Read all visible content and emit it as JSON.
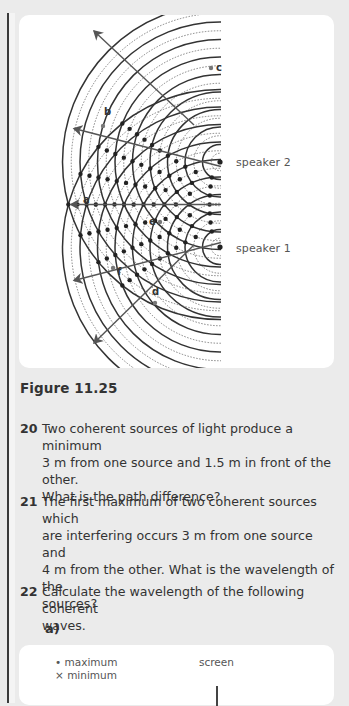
{
  "figure": {
    "speakers": [
      {
        "label": "speaker 2",
        "x": 220,
        "y": 162
      },
      {
        "label": "speaker 1",
        "x": 220,
        "y": 247
      }
    ],
    "points": [
      {
        "label": "a",
        "lx": 83,
        "ly": 200
      },
      {
        "label": "b",
        "lx": 103,
        "ly": 116
      },
      {
        "label": "c",
        "lx": 215,
        "ly": 72
      },
      {
        "label": "d",
        "lx": 152,
        "ly": 297
      },
      {
        "label": "e",
        "lx": 148,
        "ly": 226
      },
      {
        "label": "f",
        "lx": 115,
        "ly": 276
      }
    ],
    "caption": "Figure 11.25"
  },
  "questions": [
    {
      "number": "20",
      "lines": [
        "Two coherent sources of light produce a minimum",
        "3 m from one source and 1.5 m in front of the other.",
        "What is the path difference?"
      ]
    },
    {
      "number": "21",
      "lines": [
        "The first maximum of two coherent sources which",
        "are interfering occurs 3 m from one source and",
        "4 m from the other. What is the wavelength of the",
        "sources?"
      ]
    },
    {
      "number": "22",
      "lines": [
        "Calculate the wavelength of the following coherent",
        "waves."
      ]
    }
  ],
  "sub_part": "a)",
  "legend": {
    "maximum": "• maximum",
    "minimum": "× minimum",
    "screen": "screen"
  }
}
